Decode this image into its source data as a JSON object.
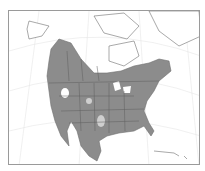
{
  "map": {
    "title": "North America range map",
    "region": "North America",
    "colors": {
      "range_fill": "#8c8c8c",
      "land_fill": "#ffffff",
      "border_line": "#6e6e6e",
      "graticule": "#e6e6e6",
      "frame": "#9a9a9a",
      "background": "#ffffff"
    },
    "legend": []
  }
}
